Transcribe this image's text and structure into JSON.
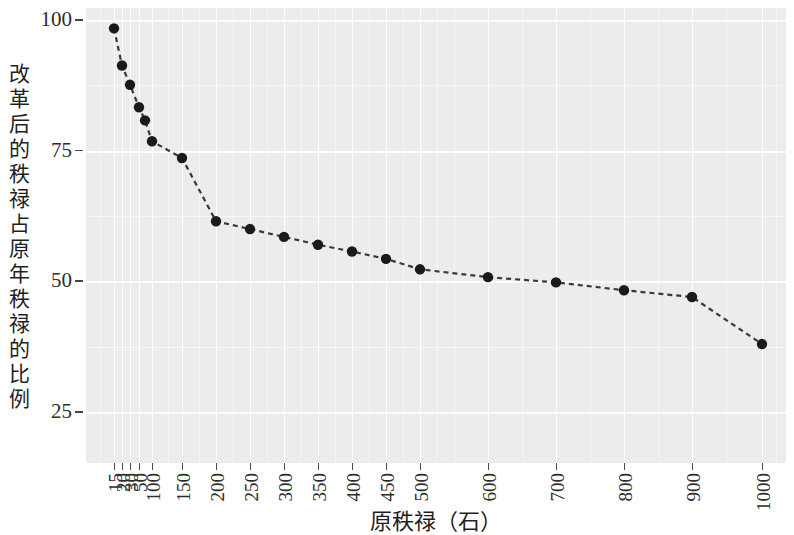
{
  "chart_data": {
    "type": "line",
    "title": "",
    "xlabel": "原秩禄（石）",
    "ylabel": "改革后的秩禄占原年秩禄的比例",
    "x_tick_labels": [
      "15",
      "20",
      "30",
      "50",
      "100",
      "150",
      "200",
      "250",
      "300",
      "350",
      "400",
      "450",
      "500",
      "600",
      "700",
      "800",
      "900",
      "1000"
    ],
    "y_tick_labels": [
      "100",
      "75",
      "50",
      "25"
    ],
    "y_ticks": [
      100,
      75,
      50,
      25
    ],
    "ylim": [
      15,
      103
    ],
    "grid": true,
    "legend": "none",
    "marker": "filled-circle",
    "line_style": "dashed",
    "series": [
      {
        "name": "改革后的秩禄占原年秩禄的比例",
        "color": "#1a1a1a",
        "points": [
          {
            "x": "15",
            "y": 98.4
          },
          {
            "x": "20",
            "y": 91.3
          },
          {
            "x": "30",
            "y": 87.6
          },
          {
            "x": "50",
            "y": 83.3
          },
          {
            "x": "60",
            "y": 80.8
          },
          {
            "x": "100",
            "y": 76.8
          },
          {
            "x": "150",
            "y": 73.6
          },
          {
            "x": "200",
            "y": 61.5
          },
          {
            "x": "250",
            "y": 60.0
          },
          {
            "x": "300",
            "y": 58.5
          },
          {
            "x": "350",
            "y": 57.0
          },
          {
            "x": "400",
            "y": 55.7
          },
          {
            "x": "450",
            "y": 54.3
          },
          {
            "x": "500",
            "y": 52.3
          },
          {
            "x": "600",
            "y": 50.8
          },
          {
            "x": "700",
            "y": 49.8
          },
          {
            "x": "800",
            "y": 48.3
          },
          {
            "x": "900",
            "y": 47.0
          },
          {
            "x": "1000",
            "y": 38.0
          }
        ]
      }
    ],
    "plot_background": "#ececec",
    "gridline_color": "#ffffff"
  }
}
